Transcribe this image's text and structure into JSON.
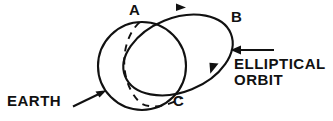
{
  "diagram": {
    "background_color": "#ffffff",
    "stroke_color": "#111111",
    "labels": {
      "point_a": "A",
      "point_b": "B",
      "point_c": "C",
      "earth": "EARTH",
      "orbit_line1": "ELLIPTICAL",
      "orbit_line2": "ORBIT"
    },
    "shapes": {
      "earth_circle": {
        "name": "earth-circle",
        "cx": 142,
        "cy": 66,
        "r": 44,
        "style": "solid"
      },
      "earth_terminator": {
        "name": "earth-terminator-arc",
        "style": "dashed",
        "description": "dashed arc from A curving left-down to C"
      },
      "orbit_ellipse": {
        "name": "orbit-ellipse",
        "style": "solid",
        "description": "tilted ellipse passing through A and C, extending right to B"
      }
    },
    "arrows": [
      {
        "name": "orbit-direction-arrow-top",
        "x": 182,
        "y": 7,
        "direction": "right",
        "description": "motion direction along top of orbit"
      },
      {
        "name": "orbit-direction-arrow-bottom",
        "x": 212,
        "y": 70,
        "direction": "down-left",
        "description": "motion direction along lower right of orbit"
      },
      {
        "name": "earth-callout-arrow",
        "from_x": 73,
        "from_y": 106,
        "to_x": 105,
        "to_y": 91,
        "direction": "up-right",
        "description": "points from EARTH label to the circle"
      },
      {
        "name": "orbit-callout-arrow",
        "from_x": 274,
        "from_y": 50,
        "to_x": 231,
        "to_y": 50,
        "direction": "left",
        "description": "points from ELLIPTICAL ORBIT label to the ellipse"
      }
    ]
  }
}
